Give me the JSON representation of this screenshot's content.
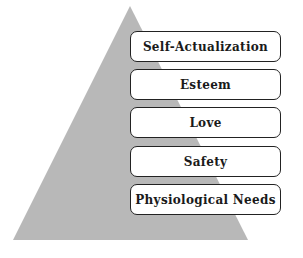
{
  "diagram": {
    "type": "pyramid",
    "colors": {
      "pyramid_fill": "#b8b8b8",
      "box_border": "#222222",
      "box_fill": "#ffffff",
      "text": "#1a1a1a"
    },
    "levels": [
      {
        "label": "Self-Actualization"
      },
      {
        "label": "Esteem"
      },
      {
        "label": "Love"
      },
      {
        "label": "Safety"
      },
      {
        "label": "Physiological Needs"
      }
    ]
  }
}
